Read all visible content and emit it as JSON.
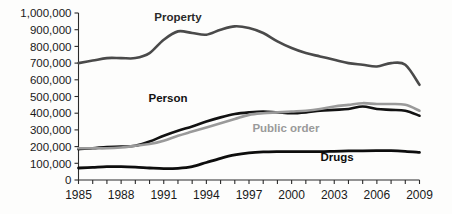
{
  "chart_data": {
    "type": "line",
    "title": "",
    "xlabel": "",
    "ylabel": "",
    "xlim": [
      1985,
      2009
    ],
    "ylim": [
      0,
      1000000
    ],
    "grid": false,
    "legend_position": "inline-labels",
    "y_ticks": [
      {
        "value": 1000000,
        "label": "1,000,000"
      },
      {
        "value": 900000,
        "label": "900,000"
      },
      {
        "value": 800000,
        "label": "800,000"
      },
      {
        "value": 700000,
        "label": "700,000"
      },
      {
        "value": 600000,
        "label": "600,000"
      },
      {
        "value": 500000,
        "label": "500,000"
      },
      {
        "value": 400000,
        "label": "400,000"
      },
      {
        "value": 300000,
        "label": "300,000"
      },
      {
        "value": 200000,
        "label": "200,000"
      },
      {
        "value": 100000,
        "label": "100,000"
      },
      {
        "value": 0,
        "label": "0"
      }
    ],
    "x_ticks": [
      1985,
      1986,
      1987,
      1988,
      1989,
      1990,
      1991,
      1992,
      1993,
      1994,
      1995,
      1996,
      1997,
      1998,
      1999,
      2000,
      2001,
      2002,
      2003,
      2004,
      2005,
      2006,
      2007,
      2008,
      2009
    ],
    "x_tick_labels": [
      {
        "value": 1985,
        "label": "1985"
      },
      {
        "value": 1988,
        "label": "1988"
      },
      {
        "value": 1991,
        "label": "1991"
      },
      {
        "value": 1994,
        "label": "1994"
      },
      {
        "value": 1997,
        "label": "1997"
      },
      {
        "value": 2000,
        "label": "2000"
      },
      {
        "value": 2003,
        "label": "2003"
      },
      {
        "value": 2006,
        "label": "2006"
      },
      {
        "value": 2009,
        "label": "2009"
      }
    ],
    "x": [
      1985,
      1986,
      1987,
      1988,
      1989,
      1990,
      1991,
      1992,
      1993,
      1994,
      1995,
      1996,
      1997,
      1998,
      1999,
      2000,
      2001,
      2002,
      2003,
      2004,
      2005,
      2006,
      2007,
      2008,
      2009
    ],
    "series": [
      {
        "name": "Property",
        "color": "#4a4a4a",
        "width": 2.6,
        "label": "Property",
        "label_x": 1992.0,
        "label_y": 950000,
        "label_color": "#2a2a2a",
        "values": [
          700000,
          715000,
          730000,
          730000,
          730000,
          760000,
          840000,
          890000,
          880000,
          870000,
          900000,
          920000,
          910000,
          880000,
          830000,
          790000,
          760000,
          740000,
          720000,
          700000,
          690000,
          680000,
          700000,
          690000,
          570000
        ]
      },
      {
        "name": "Person",
        "color": "#121212",
        "width": 2.6,
        "label": "Person",
        "label_x": 1991.3,
        "label_y": 470000,
        "label_color": "#121212",
        "values": [
          185000,
          190000,
          198000,
          200000,
          205000,
          230000,
          265000,
          295000,
          320000,
          350000,
          375000,
          395000,
          405000,
          410000,
          405000,
          400000,
          405000,
          415000,
          420000,
          425000,
          440000,
          425000,
          420000,
          415000,
          385000
        ]
      },
      {
        "name": "Public order",
        "color": "#9a9a9a",
        "width": 2.6,
        "label": "Public order",
        "label_x": 1999.6,
        "label_y": 285000,
        "label_color": "#9a9a9a",
        "values": [
          190000,
          190000,
          190000,
          195000,
          205000,
          215000,
          235000,
          265000,
          290000,
          315000,
          340000,
          365000,
          390000,
          400000,
          405000,
          410000,
          415000,
          425000,
          440000,
          450000,
          460000,
          455000,
          455000,
          450000,
          415000
        ]
      },
      {
        "name": "Drugs",
        "color": "#0d0d0d",
        "width": 2.8,
        "label": "Drugs",
        "label_x": 2003.2,
        "label_y": 112000,
        "label_color": "#0d0d0d",
        "values": [
          72000,
          76000,
          80000,
          80000,
          77000,
          72000,
          68000,
          70000,
          80000,
          105000,
          130000,
          150000,
          162000,
          168000,
          170000,
          170000,
          170000,
          170000,
          172000,
          174000,
          175000,
          176000,
          176000,
          172000,
          165000
        ]
      }
    ]
  }
}
